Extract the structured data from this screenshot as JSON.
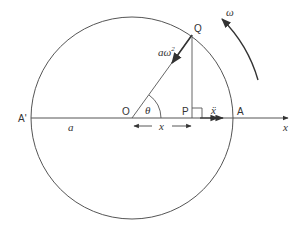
{
  "diagram": {
    "colors": {
      "stroke": "#555555",
      "text": "#333333",
      "background": "#ffffff"
    },
    "labels": {
      "Q": "Q",
      "O": "O",
      "P": "P",
      "A": "A",
      "A_prime": "A'",
      "theta": "θ",
      "omega": "ω",
      "radius": "a",
      "accel_centripetal_a": "aω",
      "accel_centripetal_sup": "2",
      "displacement": "x",
      "accel_x": "ẍ",
      "axis": "x"
    }
  }
}
